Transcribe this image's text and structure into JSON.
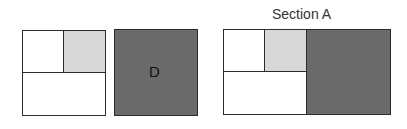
{
  "left_figure": {
    "cells": [
      {
        "id": "top-left",
        "fill": "white"
      },
      {
        "id": "top-right",
        "fill": "light-gray"
      },
      {
        "id": "bottom",
        "fill": "white"
      }
    ]
  },
  "square_d": {
    "label": "D",
    "fill": "dark-gray"
  },
  "section_a": {
    "title": "Section A",
    "cells": [
      {
        "id": "top-left",
        "fill": "white"
      },
      {
        "id": "top-middle",
        "fill": "light-gray"
      },
      {
        "id": "bottom-left",
        "fill": "white"
      },
      {
        "id": "right",
        "fill": "dark-gray"
      }
    ]
  },
  "colors": {
    "border": "#2b2b2b",
    "light_gray": "#d8d8d8",
    "dark_gray": "#6a6a6a",
    "white": "#ffffff"
  }
}
